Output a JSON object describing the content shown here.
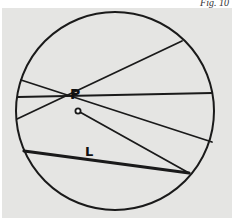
{
  "figure": {
    "caption": "Fig. 10",
    "background_color": "#e5e5e3",
    "stroke_color": "#1a1a1a",
    "circle": {
      "cx": 115,
      "cy": 111,
      "r": 99
    },
    "point": {
      "label": "P",
      "x": 78,
      "y": 111,
      "label_x": 70,
      "label_y": 99
    },
    "chord_label": {
      "label": "L",
      "x": 85,
      "y": 156
    },
    "chords_through_P": [
      {
        "x1": 21,
        "y1": 80,
        "x2": 212,
        "y2": 142
      },
      {
        "x1": 18,
        "y1": 97,
        "x2": 212,
        "y2": 93
      },
      {
        "x1": 17,
        "y1": 119,
        "x2": 182,
        "y2": 41
      },
      {
        "x1": 24,
        "y1": 151,
        "x2": 189,
        "y2": 173
      }
    ],
    "chord_L": {
      "x1": 24,
      "y1": 151,
      "x2": 189,
      "y2": 173
    },
    "line_P_to_L_end": {
      "x1": 78,
      "y1": 111,
      "x2": 189,
      "y2": 173
    },
    "line_P_to_L_start": {
      "x1": 78,
      "y1": 111,
      "x2": 24,
      "y2": 151
    }
  }
}
